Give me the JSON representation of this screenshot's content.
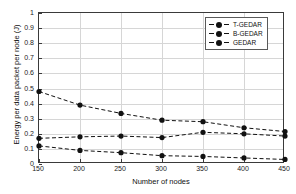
{
  "chart_data": {
    "type": "line",
    "title": "",
    "xlabel": "Number of nodes",
    "ylabel": "Energy per data packet per node (J)",
    "x": [
      150,
      200,
      250,
      300,
      350,
      400,
      450
    ],
    "xlim": [
      150,
      450
    ],
    "ylim": [
      0,
      1
    ],
    "xticks": [
      "150",
      "200",
      "250",
      "300",
      "350",
      "400",
      "450"
    ],
    "yticks": [
      "0",
      "0.1",
      "0.2",
      "0.3",
      "0.4",
      "0.5",
      "0.6",
      "0.7",
      "0.8",
      "0.9",
      "1"
    ],
    "grid": true,
    "legend_position": "upper-right",
    "marker": "filled-circle",
    "linestyle": "dashed",
    "series": [
      {
        "name": "T-GEDAR",
        "values": [
          0.48,
          0.39,
          0.335,
          0.29,
          0.28,
          0.24,
          0.215
        ],
        "color": "#111111"
      },
      {
        "name": "B-GEDAR",
        "values": [
          0.17,
          0.18,
          0.185,
          0.175,
          0.21,
          0.2,
          0.185
        ],
        "color": "#111111"
      },
      {
        "name": "GEDAR",
        "values": [
          0.12,
          0.09,
          0.075,
          0.055,
          0.05,
          0.04,
          0.03
        ],
        "color": "#111111"
      }
    ]
  },
  "legend": {
    "items": [
      {
        "label": "T-GEDAR"
      },
      {
        "label": "B-GEDAR"
      },
      {
        "label": "GEDAR"
      }
    ]
  },
  "axes": {
    "x_title": "Number of nodes",
    "y_title": "Energy per data packet per node (J)"
  }
}
